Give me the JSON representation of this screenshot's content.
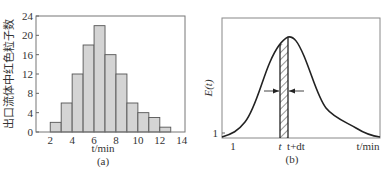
{
  "chart_data": [
    {
      "type": "bar",
      "panel_label": "(a)",
      "title": "",
      "xlabel": "t/min",
      "ylabel": "出口流体中红色粒子数",
      "x_ticks": [
        "2",
        "4",
        "6",
        "8",
        "10",
        "12",
        "14"
      ],
      "y_ticks": [
        "0",
        "4",
        "8",
        "12",
        "16",
        "20",
        "24"
      ],
      "xlim": [
        0.7,
        14.3
      ],
      "ylim": [
        0,
        24
      ],
      "grid": false,
      "bins": [
        {
          "from": 2,
          "to": 3,
          "value": 2
        },
        {
          "from": 3,
          "to": 4,
          "value": 6
        },
        {
          "from": 4,
          "to": 5,
          "value": 12
        },
        {
          "from": 5,
          "to": 6,
          "value": 18
        },
        {
          "from": 6,
          "to": 7,
          "value": 22
        },
        {
          "from": 7,
          "to": 8,
          "value": 16
        },
        {
          "from": 8,
          "to": 9,
          "value": 12
        },
        {
          "from": 9,
          "to": 10,
          "value": 6
        },
        {
          "from": 10,
          "to": 11,
          "value": 4
        },
        {
          "from": 11,
          "to": 12,
          "value": 3
        },
        {
          "from": 12,
          "to": 13,
          "value": 1
        }
      ],
      "categories": [
        "2-3",
        "3-4",
        "4-5",
        "5-6",
        "6-7",
        "7-8",
        "8-9",
        "9-10",
        "10-11",
        "11-12",
        "12-13"
      ],
      "values": [
        2,
        6,
        12,
        18,
        22,
        16,
        12,
        6,
        4,
        3,
        1
      ],
      "bar_color": "#d4d4d4"
    },
    {
      "type": "line",
      "panel_label": "(b)",
      "title": "",
      "xlabel": "t/min",
      "ylabel": "E(t)",
      "x_tick_labels": [
        "1",
        "t",
        "t+dt"
      ],
      "y_tick_labels": [
        "1"
      ],
      "grid": false,
      "annotations": [
        "hatched strip between t and t+dt",
        "arrows pointing to strip edges"
      ],
      "curve_description": "unimodal bell-shaped residence time distribution, right-skewed tail"
    }
  ]
}
